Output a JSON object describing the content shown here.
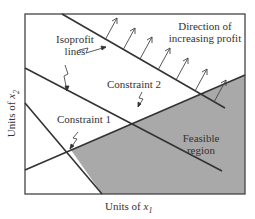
{
  "diagram": {
    "type": "linear-programming-graph",
    "x_axis_label": "Units of x",
    "x_axis_subscript": "1",
    "y_axis_label": "Units of x",
    "y_axis_subscript": "2",
    "labels": {
      "isoprofit_line1": "Isoprofit",
      "isoprofit_line2": "lines",
      "direction_line1": "Direction of",
      "direction_line2": "increasing profit",
      "constraint1": "Constraint 1",
      "constraint2": "Constraint 2",
      "feasible_line1": "Feasible",
      "feasible_line2": "region"
    },
    "colors": {
      "feasible_fill": "#a9a9a9",
      "line": "#333333",
      "background": "#ffffff"
    }
  }
}
